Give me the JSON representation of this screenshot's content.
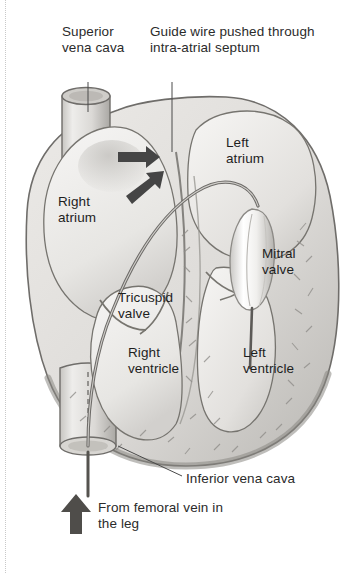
{
  "figure": {
    "domain": "diagram",
    "background_color": "#ffffff",
    "text_color": "#2b2b2b",
    "width": 358,
    "height": 573
  },
  "callouts": [
    {
      "id": "superior-vena-cava",
      "text": "Superior\nvena cava",
      "x": 62,
      "y": 24,
      "leader": "vertical"
    },
    {
      "id": "guide-wire",
      "text": "Guide wire pushed through\nintra-atrial septum",
      "x": 150,
      "y": 24,
      "leader": "vertical"
    },
    {
      "id": "inferior-vena-cava",
      "text": "Inferior vena cava",
      "x": 186,
      "y": 471,
      "leader": "diagonal"
    },
    {
      "id": "from-femoral-vein",
      "text": "From femoral vein in\nthe leg",
      "x": 98,
      "y": 500,
      "leader": "arrow"
    }
  ],
  "chamber_labels": [
    {
      "id": "right-atrium",
      "text": "Right\natrium",
      "x": 58,
      "y": 194
    },
    {
      "id": "left-atrium",
      "text": "Left\natrium",
      "x": 226,
      "y": 135
    },
    {
      "id": "mitral-valve",
      "text": "Mitral\nvalve",
      "x": 262,
      "y": 246
    },
    {
      "id": "tricuspid-valve",
      "text": "Tricuspid\nvalve",
      "x": 118,
      "y": 290
    },
    {
      "id": "right-ventricle",
      "text": "Right\nventricle",
      "x": 128,
      "y": 345
    },
    {
      "id": "left-ventricle",
      "text": "Left\nventricle",
      "x": 243,
      "y": 345
    }
  ],
  "colors": {
    "myocardium_fill": "#e3e2e0",
    "myocardium_edge": "#7d7b78",
    "chamber_fill": "#efeeec",
    "vessel_fill": "#dedcd9",
    "catheter_stroke": "#6d6b68",
    "arrow_fill": "#4a4a4a",
    "balloon_fill": "#fbfbfa",
    "outline": "#5e5c59"
  },
  "annotations": {
    "septal_arrow_count": 2,
    "balloon_catheter": "balloon at mitral valve with wire into left ventricle",
    "ivc_dashed_catheter": true
  }
}
